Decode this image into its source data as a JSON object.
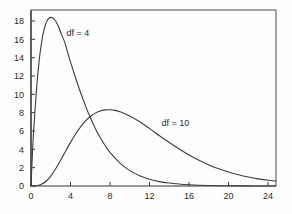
{
  "chart_data": {
    "type": "line",
    "title": "",
    "subtitle": "",
    "xlabel": "",
    "ylabel": "",
    "xlim": [
      0,
      24.8
    ],
    "ylim": [
      0,
      19.2
    ],
    "xticks": [
      0,
      4,
      8,
      12,
      16,
      20,
      24
    ],
    "xtick_labels": [
      "0",
      "4",
      "8",
      "12",
      "16",
      "20",
      "24"
    ],
    "yticks": [
      0,
      2,
      4,
      6,
      8,
      10,
      12,
      14,
      16,
      18
    ],
    "ytick_labels": [
      "0",
      "2",
      "4",
      "6",
      "8",
      "10",
      "12",
      "14",
      "16",
      "18"
    ],
    "grid": false,
    "legend_position": "inline-annotations",
    "frame": "box",
    "annotations": [
      {
        "text": "df = 4",
        "x": 3.6,
        "y": 16.4
      },
      {
        "text": "df = 10",
        "x": 13.2,
        "y": 6.6
      }
    ],
    "series": [
      {
        "name": "df = 4",
        "label": "df = 4",
        "color": "#3c3c3c",
        "peak_x": 2.0,
        "peak_y": 18.3,
        "x": [
          0,
          0.2,
          0.4,
          0.6,
          0.8,
          1.0,
          1.2,
          1.4,
          1.6,
          1.8,
          2.0,
          2.2,
          2.4,
          2.6,
          2.8,
          3.0,
          3.4,
          3.8,
          4.2,
          4.6,
          5.0,
          5.5,
          6.0,
          6.5,
          7.0,
          7.5,
          8.0,
          9.0,
          10.0,
          11.0,
          12.0,
          13.0,
          14.0,
          15.0,
          16.0,
          18.0,
          20.0,
          22.0,
          24.0,
          24.8
        ],
        "y": [
          0,
          4.76,
          8.19,
          11.11,
          13.41,
          15.16,
          16.46,
          17.37,
          17.96,
          18.29,
          18.39,
          18.32,
          18.11,
          17.79,
          17.37,
          16.74,
          15.73,
          14.23,
          12.85,
          11.51,
          10.26,
          8.8,
          7.47,
          6.31,
          5.28,
          4.42,
          3.66,
          2.5,
          1.68,
          1.13,
          0.74,
          0.48,
          0.32,
          0.21,
          0.13,
          0.05,
          0.02,
          0.01,
          0.0,
          0.0
        ]
      },
      {
        "name": "df = 10",
        "label": "df = 10",
        "color": "#3c3c3c",
        "peak_x": 8.0,
        "peak_y": 9.6,
        "x": [
          0,
          0.5,
          1.0,
          1.5,
          2.0,
          2.5,
          3.0,
          3.5,
          4.0,
          4.5,
          5.0,
          5.5,
          6.0,
          6.5,
          7.0,
          7.5,
          8.0,
          8.5,
          9.0,
          9.5,
          10.0,
          11.0,
          12.0,
          13.0,
          14.0,
          15.0,
          16.0,
          17.0,
          18.0,
          19.0,
          20.0,
          21.0,
          22.0,
          23.0,
          24.0,
          24.8
        ],
        "y": [
          0,
          0.02,
          0.16,
          0.49,
          1.08,
          1.88,
          2.81,
          3.8,
          4.76,
          5.65,
          6.42,
          7.07,
          7.58,
          7.95,
          8.18,
          8.3,
          8.32,
          8.25,
          8.1,
          7.89,
          7.63,
          7.0,
          6.26,
          5.49,
          4.74,
          4.03,
          3.38,
          2.8,
          2.3,
          1.88,
          1.53,
          1.23,
          0.98,
          0.78,
          0.62,
          0.54
        ]
      }
    ]
  },
  "axes": {
    "y_axis_name": "vertical-axis",
    "x_axis_name": "horizontal-axis"
  }
}
